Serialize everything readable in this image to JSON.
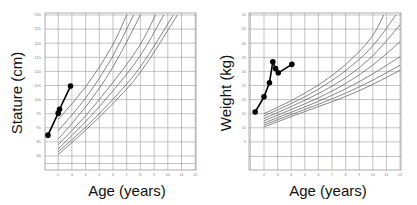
{
  "chart_data": [
    {
      "type": "line",
      "title": "",
      "xlabel": "Age (years)",
      "ylabel": "Stature (cm)",
      "xlim": [
        1,
        12
      ],
      "ylim": [
        75,
        130
      ],
      "grid": true,
      "x_ticks": [
        1,
        2,
        3,
        4,
        5,
        6,
        7,
        8,
        9,
        10,
        11,
        12
      ],
      "x_tick_labels": [
        "",
        "2",
        "3",
        "4",
        "5",
        "6",
        "7",
        "8",
        "9",
        "10",
        "11",
        "12"
      ],
      "y_ticks": [
        80,
        85,
        90,
        95,
        100,
        105,
        110,
        115,
        120,
        125,
        130
      ],
      "y_tick_labels": [
        "80",
        "85",
        "90",
        "95",
        "100",
        "105",
        "110",
        "115",
        "120",
        "125",
        "130"
      ],
      "reference_curves": [
        {
          "name": "curve-1",
          "x": [
            2,
            4,
            6,
            7
          ],
          "y": [
            93,
            104,
            119,
            130
          ]
        },
        {
          "name": "curve-2",
          "x": [
            2,
            4,
            6,
            7.5
          ],
          "y": [
            89,
            100,
            115,
            130
          ]
        },
        {
          "name": "curve-3",
          "x": [
            2,
            4,
            6,
            8
          ],
          "y": [
            86,
            97,
            111,
            130
          ]
        },
        {
          "name": "curve-4",
          "x": [
            2,
            4,
            6,
            8,
            9.1
          ],
          "y": [
            84,
            94,
            106,
            119,
            130
          ]
        },
        {
          "name": "curve-5",
          "x": [
            2,
            4,
            6,
            8,
            9.7
          ],
          "y": [
            82.5,
            92,
            103,
            115,
            130
          ]
        },
        {
          "name": "curve-6",
          "x": [
            2,
            4,
            6,
            8,
            10.4
          ],
          "y": [
            81.5,
            90,
            100,
            111,
            130
          ]
        },
        {
          "name": "curve-7",
          "x": [
            2,
            4,
            6,
            8,
            10.7
          ],
          "y": [
            80.5,
            89,
            98.5,
            109,
            130
          ]
        }
      ],
      "series": [
        {
          "name": "patient-stature",
          "x": [
            1.25,
            2.0,
            2.1,
            2.9
          ],
          "y": [
            87.4,
            95.2,
            96.6,
            104.8
          ]
        }
      ]
    },
    {
      "type": "line",
      "title": "",
      "xlabel": "Age (years)",
      "ylabel": "Weight (kg)",
      "xlim": [
        1,
        12
      ],
      "ylim": [
        -3,
        50
      ],
      "grid": true,
      "x_ticks": [
        1,
        2,
        3,
        4,
        5,
        6,
        7,
        8,
        9,
        10,
        11,
        12
      ],
      "x_tick_labels": [
        "",
        "2",
        "3",
        "4",
        "5",
        "6",
        "7",
        "8",
        "9",
        "10",
        "11",
        "12"
      ],
      "y_ticks": [
        5,
        10,
        15,
        20,
        25,
        30,
        35,
        40,
        45,
        50
      ],
      "y_tick_labels": [
        "5",
        "10",
        "15",
        "20",
        "25",
        "30",
        "35",
        "40",
        "45",
        "50"
      ],
      "reference_curves": [
        {
          "name": "curve-1",
          "x": [
            2,
            4,
            6,
            8,
            10,
            10.8
          ],
          "y": [
            15,
            19.5,
            25,
            32,
            42,
            50
          ]
        },
        {
          "name": "curve-2",
          "x": [
            2,
            4,
            6,
            8,
            10,
            11.7
          ],
          "y": [
            14.2,
            18.5,
            23.5,
            30,
            38.5,
            50
          ]
        },
        {
          "name": "curve-3",
          "x": [
            2,
            4,
            6,
            8,
            10,
            12
          ],
          "y": [
            13.3,
            17.5,
            22,
            27.5,
            35,
            46.5
          ]
        },
        {
          "name": "curve-4",
          "x": [
            2,
            4,
            6,
            8,
            10,
            12
          ],
          "y": [
            12.5,
            16.5,
            20.5,
            25.5,
            32,
            40.5
          ]
        },
        {
          "name": "curve-5",
          "x": [
            2,
            4,
            6,
            8,
            10,
            12
          ],
          "y": [
            11.7,
            15.5,
            19.3,
            23.7,
            29,
            35.2
          ]
        },
        {
          "name": "curve-6",
          "x": [
            2,
            4,
            6,
            8,
            10,
            12
          ],
          "y": [
            11,
            14.7,
            18.3,
            22.2,
            26.8,
            32.2
          ]
        },
        {
          "name": "curve-7",
          "x": [
            2,
            4,
            6,
            8,
            10,
            12
          ],
          "y": [
            10.3,
            14,
            17.5,
            21,
            25.3,
            30.4
          ]
        }
      ],
      "series": [
        {
          "name": "patient-weight",
          "x": [
            1.35,
            2.0,
            2.4,
            2.65,
            2.85,
            3.05,
            4.05
          ],
          "y": [
            15.6,
            21,
            26,
            33.4,
            31,
            29.5,
            32.5
          ]
        }
      ]
    }
  ]
}
